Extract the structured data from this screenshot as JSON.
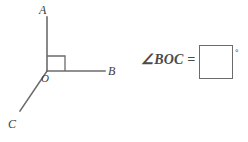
{
  "figure": {
    "name": "angle-diagram",
    "vertex_label": "O",
    "points": [
      {
        "id": "A",
        "label": "A"
      },
      {
        "id": "B",
        "label": "B"
      },
      {
        "id": "C",
        "label": "C"
      }
    ],
    "rays": [
      {
        "id": "OA",
        "from": "O",
        "to": "A"
      },
      {
        "id": "OB",
        "from": "O",
        "to": "B"
      },
      {
        "id": "OC",
        "from": "O",
        "to": "C"
      }
    ],
    "right_angle_marker": {
      "between": "OA and OB",
      "measure": 90
    },
    "line_color": "#6b6b6b"
  },
  "question": {
    "angle_symbol": "∠",
    "angle_name": "BOC",
    "equals": "=",
    "expression": "∠BOC =",
    "degree_symbol": "°"
  },
  "answer": {
    "value": "",
    "placeholder": ""
  }
}
